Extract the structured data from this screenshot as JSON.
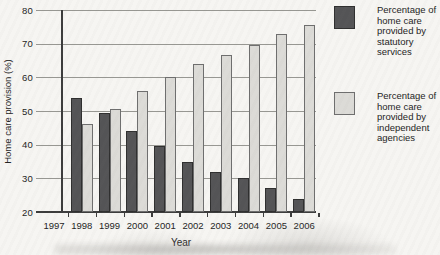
{
  "chart_data": {
    "type": "bar",
    "title": "",
    "xlabel": "Year",
    "ylabel": "Home care provision (%)",
    "ylim": [
      20,
      80
    ],
    "yticks": [
      20,
      30,
      40,
      50,
      60,
      70,
      80
    ],
    "grid": true,
    "legend_position": "right",
    "categories": [
      "1997",
      "1998",
      "1999",
      "2000",
      "2001",
      "2002",
      "2003",
      "2004",
      "2005",
      "2006"
    ],
    "series": [
      {
        "name": "Percentage of home care provided by statutory services",
        "color": "#545456",
        "border": "#2f2f2f",
        "values": [
          null,
          54,
          49.5,
          44,
          39.5,
          35,
          32,
          30,
          27,
          24
        ]
      },
      {
        "name": "Percentage of home care provided by independent agencies",
        "color": "#dcdbd7",
        "border": "#6e6e6e",
        "values": [
          null,
          46,
          50.5,
          56,
          60,
          64,
          66.5,
          69.5,
          73,
          75.5
        ]
      }
    ],
    "legend": [
      {
        "lines": "Percentage of\nhome care\nprovided by\nstatutory\nservices"
      },
      {
        "lines": "Percentage of\nhome care\nprovided by\nindependent\nagencies"
      }
    ]
  }
}
